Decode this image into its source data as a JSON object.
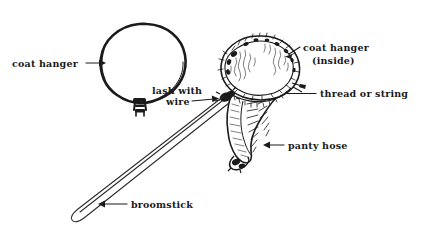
{
  "figure": {
    "background_color": "#ffffff",
    "ink_color": "#1b1b1b",
    "width": 421,
    "height": 239
  },
  "labels": [
    {
      "id": "coat-hanger",
      "text": "coat hanger",
      "x": 12,
      "y": 67,
      "anchor": "start",
      "leader": "arrow-right",
      "describes": "wire coat hanger bent into a loop"
    },
    {
      "id": "lash-with-wire-line1",
      "text": "lash with",
      "x": 152,
      "y": 94,
      "anchor": "start",
      "leader": "arrow-right",
      "describes": "join between broomstick and hanger"
    },
    {
      "id": "lash-with-wire-line2",
      "text": "wire",
      "x": 166,
      "y": 105,
      "anchor": "start",
      "leader": "none",
      "describes": "second line of lash with wire label"
    },
    {
      "id": "coat-hanger-inside-line1",
      "text": "coat hanger",
      "x": 303,
      "y": 51,
      "anchor": "start",
      "leader": "short-diagonal",
      "describes": "hanger rim hidden inside the hose"
    },
    {
      "id": "coat-hanger-inside-line2",
      "text": "(inside)",
      "x": 312,
      "y": 64,
      "anchor": "start",
      "leader": "none",
      "describes": "second line of coat hanger inside label"
    },
    {
      "id": "thread-or-string",
      "text": "thread or string",
      "x": 320,
      "y": 97,
      "anchor": "start",
      "leader": "horizontal-line",
      "describes": "thread binding hose to hanger"
    },
    {
      "id": "panty-hose",
      "text": "panty hose",
      "x": 288,
      "y": 149,
      "anchor": "start",
      "leader": "arrow-left",
      "describes": "stocking forming the net bag"
    },
    {
      "id": "broomstick",
      "text": "broomstick",
      "x": 131,
      "y": 208,
      "anchor": "start",
      "leader": "arrow-left",
      "describes": "wooden handle"
    }
  ],
  "parts": {
    "hanger_loop": "coat hanger bent into an egg shaped ring with twisted stem",
    "net_ring": "hanger ring sheathed in panty hose at top right",
    "net_bag": "tapered hose bag hanging below the ring ending in a knot",
    "handle": "broomstick running from lower left up to the net junction"
  }
}
